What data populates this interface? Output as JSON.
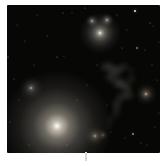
{
  "image": {
    "description": "Deep-space photograph of a galaxy group: a large bright elliptical galaxy at lower left, a second bright galaxy at top with two compact companions, smaller galaxies at mid-left, right edge and bottom center, a faint irregular wispy nebula on the right half, and scattered faint stars on a near-black sky, all inside a white frame",
    "background_color": "#ffffff",
    "sky_color": "#070706",
    "frame": {
      "left": 7,
      "top": 5,
      "width": 153,
      "height": 148
    }
  },
  "objects": {
    "galaxies": [
      {
        "name": "large-elliptical-galaxy",
        "x": 50,
        "y": 121,
        "halo": 112,
        "intensity": 1.0,
        "core": "#ffffff",
        "glow": "#c7c0b2"
      },
      {
        "name": "bright-galaxy-top",
        "x": 93,
        "y": 28,
        "halo": 42,
        "intensity": 0.92,
        "core": "#fdfcf8",
        "glow": "#b9b4a9"
      },
      {
        "name": "companion-galaxy-a",
        "x": 85,
        "y": 16,
        "halo": 13,
        "intensity": 0.85,
        "core": "#f4f2ec",
        "glow": "#a9a59c"
      },
      {
        "name": "companion-galaxy-b",
        "x": 100,
        "y": 15,
        "halo": 14,
        "intensity": 0.85,
        "core": "#f4f2ec",
        "glow": "#a9a59c"
      },
      {
        "name": "galaxy-mid-left",
        "x": 24,
        "y": 83,
        "halo": 24,
        "intensity": 0.62,
        "core": "#e8e4da",
        "glow": "#9a968c"
      },
      {
        "name": "galaxy-right-edge",
        "x": 139,
        "y": 89,
        "halo": 22,
        "intensity": 0.68,
        "core": "#efe6d2",
        "glow": "#b3a487"
      },
      {
        "name": "galaxy-bottom-double-a",
        "x": 88,
        "y": 131,
        "halo": 21,
        "intensity": 0.62,
        "core": "#ece7da",
        "glow": "#a89d88"
      },
      {
        "name": "galaxy-bottom-double-b",
        "x": 96,
        "y": 130,
        "halo": 12,
        "intensity": 0.48,
        "core": "#ddd8cc",
        "glow": "#968f7e"
      }
    ],
    "stars": [
      {
        "x": 128,
        "y": 6,
        "size": 2,
        "opacity": 0.9
      },
      {
        "x": 143,
        "y": 18,
        "size": 1,
        "opacity": 0.5
      },
      {
        "x": 146,
        "y": 21,
        "size": 1,
        "opacity": 0.3
      },
      {
        "x": 56,
        "y": 8,
        "size": 1,
        "opacity": 0.4
      },
      {
        "x": 110,
        "y": 10,
        "size": 1,
        "opacity": 0.35
      },
      {
        "x": 120,
        "y": 25,
        "size": 1,
        "opacity": 0.3
      },
      {
        "x": 30,
        "y": 10,
        "size": 1,
        "opacity": 0.3
      },
      {
        "x": 10,
        "y": 20,
        "size": 1,
        "opacity": 0.3
      },
      {
        "x": 18,
        "y": 36,
        "size": 1,
        "opacity": 0.35
      },
      {
        "x": 40,
        "y": 31,
        "size": 1,
        "opacity": 0.4
      },
      {
        "x": 1,
        "y": 52,
        "size": 1,
        "opacity": 0.5
      },
      {
        "x": 7,
        "y": 74,
        "size": 1,
        "opacity": 0.4
      },
      {
        "x": 50,
        "y": 52,
        "size": 1,
        "opacity": 0.45
      },
      {
        "x": 57,
        "y": 51,
        "size": 1,
        "opacity": 0.3
      },
      {
        "x": 65,
        "y": 8,
        "size": 1,
        "opacity": 0.3
      },
      {
        "x": 78,
        "y": 3,
        "size": 1,
        "opacity": 0.35
      },
      {
        "x": 115,
        "y": 43,
        "size": 1,
        "opacity": 0.4
      },
      {
        "x": 130,
        "y": 43,
        "size": 2,
        "opacity": 0.45
      },
      {
        "x": 138,
        "y": 45,
        "size": 1,
        "opacity": 0.35
      },
      {
        "x": 152,
        "y": 37,
        "size": 1,
        "opacity": 0.3
      },
      {
        "x": 145,
        "y": 60,
        "size": 1,
        "opacity": 0.35
      },
      {
        "x": 150,
        "y": 75,
        "size": 1,
        "opacity": 0.3
      },
      {
        "x": 27,
        "y": 60,
        "size": 1,
        "opacity": 0.3
      },
      {
        "x": 12,
        "y": 95,
        "size": 1,
        "opacity": 0.35
      },
      {
        "x": 3,
        "y": 117,
        "size": 1,
        "opacity": 0.3
      },
      {
        "x": 22,
        "y": 140,
        "size": 1,
        "opacity": 0.3
      },
      {
        "x": 60,
        "y": 140,
        "size": 1,
        "opacity": 0.3
      },
      {
        "x": 70,
        "y": 95,
        "size": 1,
        "opacity": 0.35
      },
      {
        "x": 80,
        "y": 80,
        "size": 1,
        "opacity": 0.3
      },
      {
        "x": 90,
        "y": 60,
        "size": 1,
        "opacity": 0.35
      },
      {
        "x": 100,
        "y": 100,
        "size": 1,
        "opacity": 0.3
      },
      {
        "x": 126,
        "y": 129,
        "size": 2,
        "opacity": 0.55
      },
      {
        "x": 134,
        "y": 138,
        "size": 1,
        "opacity": 0.35
      },
      {
        "x": 140,
        "y": 140,
        "size": 1,
        "opacity": 0.3
      },
      {
        "x": 148,
        "y": 122,
        "size": 1,
        "opacity": 0.3
      },
      {
        "x": 152,
        "y": 108,
        "size": 1,
        "opacity": 0.3
      },
      {
        "x": 118,
        "y": 133,
        "size": 1,
        "opacity": 0.3
      },
      {
        "x": 104,
        "y": 127,
        "size": 1,
        "opacity": 0.3
      }
    ],
    "nebula": {
      "name": "wispy-nebula",
      "color": "#8d8d81",
      "patches": [
        {
          "x": 101,
          "y": 62,
          "rx": 8,
          "ry": 5,
          "opacity": 0.38
        },
        {
          "x": 109,
          "y": 66,
          "rx": 7,
          "ry": 5,
          "opacity": 0.42
        },
        {
          "x": 116,
          "y": 62,
          "rx": 6,
          "ry": 4,
          "opacity": 0.3
        },
        {
          "x": 124,
          "y": 66,
          "rx": 4,
          "ry": 3,
          "opacity": 0.22
        },
        {
          "x": 104,
          "y": 72,
          "rx": 6,
          "ry": 5,
          "opacity": 0.36
        },
        {
          "x": 112,
          "y": 78,
          "rx": 7,
          "ry": 6,
          "opacity": 0.42
        },
        {
          "x": 119,
          "y": 82,
          "rx": 6,
          "ry": 5,
          "opacity": 0.4
        },
        {
          "x": 124,
          "y": 74,
          "rx": 5,
          "ry": 4,
          "opacity": 0.26
        },
        {
          "x": 121,
          "y": 90,
          "rx": 6,
          "ry": 5,
          "opacity": 0.36
        },
        {
          "x": 114,
          "y": 92,
          "rx": 5,
          "ry": 5,
          "opacity": 0.3
        },
        {
          "x": 110,
          "y": 99,
          "rx": 5,
          "ry": 6,
          "opacity": 0.3
        },
        {
          "x": 109,
          "y": 107,
          "rx": 4,
          "ry": 6,
          "opacity": 0.24
        },
        {
          "x": 104,
          "y": 115,
          "rx": 4,
          "ry": 5,
          "opacity": 0.18
        },
        {
          "x": 102,
          "y": 121,
          "rx": 3,
          "ry": 4,
          "opacity": 0.14
        }
      ]
    }
  },
  "artifact": {
    "x": 85,
    "y": 152,
    "width": 2,
    "height": 9,
    "color": "#d9d9d9"
  }
}
